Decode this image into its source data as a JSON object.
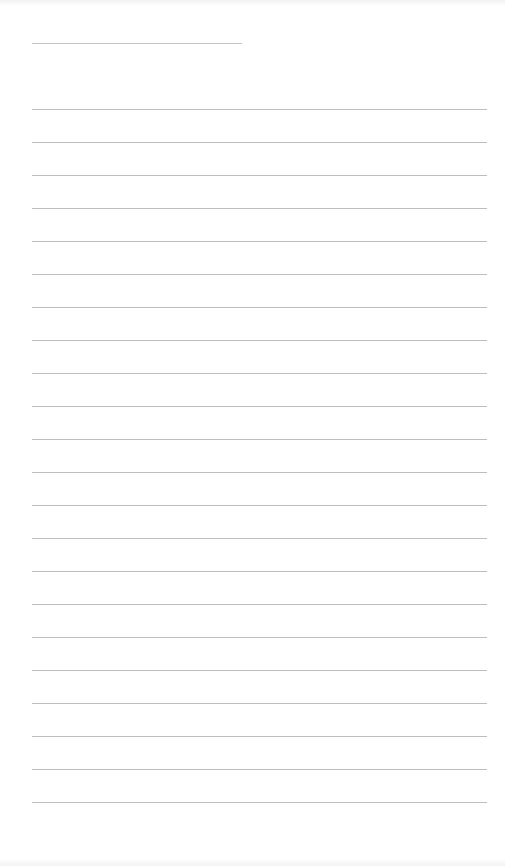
{
  "document": {
    "type": "lined-notepad-page",
    "title_line": {
      "text": "",
      "length_px": 210
    },
    "ruled_lines": {
      "count": 22,
      "spacing_px": 33,
      "entries": [
        "",
        "",
        "",
        "",
        "",
        "",
        "",
        "",
        "",
        "",
        "",
        "",
        "",
        "",
        "",
        "",
        "",
        "",
        "",
        "",
        "",
        ""
      ]
    },
    "colors": {
      "background": "#ffffff",
      "rule": "#bdbdbd"
    }
  }
}
